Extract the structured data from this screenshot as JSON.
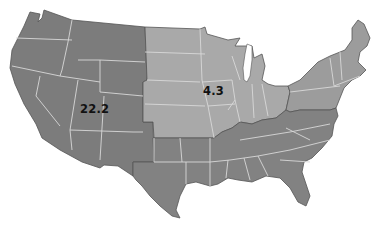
{
  "map": {
    "type": "choropleth",
    "subject": "United States (contiguous), census regions",
    "colors": {
      "west": "#7c7c7c",
      "midwest": "#a9a9a9",
      "south": "#828282",
      "northeast": "#9c9c9c",
      "state_border": "#d8d8d8",
      "outline": "#555555"
    },
    "labels": [
      {
        "region": "West",
        "value": "22.2"
      },
      {
        "region": "Midwest",
        "value": "4.3"
      }
    ]
  }
}
